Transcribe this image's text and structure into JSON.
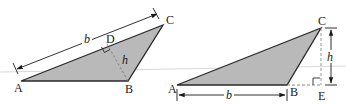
{
  "figures": [
    {
      "id": "left",
      "description": "Obtuse triangle with altitude h from B to side AC, base b = AC",
      "vertices": {
        "A": {
          "label": "A",
          "x": 21,
          "y": 81
        },
        "B": {
          "label": "B",
          "x": 128,
          "y": 81
        },
        "C": {
          "label": "C",
          "x": 163,
          "y": 25
        }
      },
      "foot": {
        "label": "D",
        "x": 107,
        "y": 44
      },
      "base_label": "b",
      "height_label": "h"
    },
    {
      "id": "right",
      "description": "Obtuse triangle with external altitude h from C to extension of AB at E, base b = AB",
      "vertices": {
        "A": {
          "label": "A",
          "x": 177,
          "y": 85
        },
        "B": {
          "label": "B",
          "x": 287,
          "y": 85
        },
        "C": {
          "label": "C",
          "x": 321,
          "y": 28
        }
      },
      "foot": {
        "label": "E",
        "x": 321,
        "y": 85
      },
      "base_label": "b",
      "height_label": "h"
    }
  ],
  "colors": {
    "fill": "#b9b9b9",
    "stroke": "#2a2a2a",
    "dashed": "#8a8a8a",
    "guide": "#c8c8c8"
  }
}
